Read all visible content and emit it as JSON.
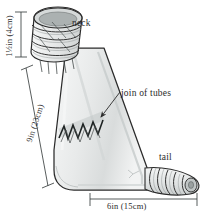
{
  "figure": {
    "type": "technical-illustration",
    "background_color": "#ffffff",
    "ink_color": "#2b2b2b",
    "body_fill": "#eceeee"
  },
  "labels": {
    "neck": "neck",
    "join_of_tubes": "join of tubes",
    "tail": "tail",
    "neck_diameter": "1½in (4cm)",
    "body_length": "9in (23cm)",
    "base_width": "6in (15cm)"
  },
  "annotations": {
    "leader_to_join": "leader-line-arrow",
    "zigzag_seam": "zigzag-stitch-seam",
    "neck_ribs": "coiled-cuff-ribs",
    "tail_ribs": "coiled-tail-ribs"
  },
  "dimensions": {
    "neck_diameter_in": 1.5,
    "neck_diameter_cm": 4,
    "body_length_in": 9,
    "body_length_cm": 23,
    "base_width_in": 6,
    "base_width_cm": 15
  }
}
